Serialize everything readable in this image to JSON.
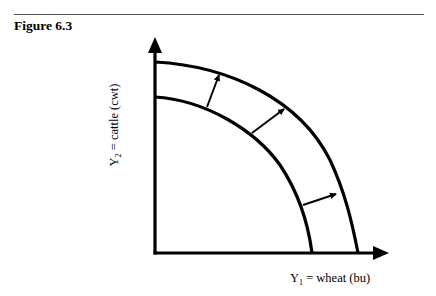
{
  "figure": {
    "label": "Figure 6.3"
  },
  "axes": {
    "y": {
      "var": "Y",
      "subscript": "2",
      "rest": " = cattle (cwt)",
      "full": "Y2 = cattle (cwt)"
    },
    "x": {
      "var": "Y",
      "subscript": "1",
      "rest": " = wheat (bu)",
      "full": "Y1 = wheat (bu)"
    }
  },
  "curves": [
    {
      "name": "inner-production-possibilities-curve",
      "y_intercept_px": [
        155,
        97
      ],
      "x_intercept_px": [
        312,
        253
      ]
    },
    {
      "name": "outer-production-possibilities-curve",
      "y_intercept_px": [
        155,
        62
      ],
      "x_intercept_px": [
        358,
        253
      ]
    }
  ],
  "shift_arrows": [
    {
      "from": [
        207,
        107
      ],
      "to": [
        220,
        73
      ]
    },
    {
      "from": [
        252,
        133
      ],
      "to": [
        286,
        108
      ]
    },
    {
      "from": [
        303,
        205
      ],
      "to": [
        338,
        194
      ]
    }
  ],
  "colors": {
    "stroke": "#000000",
    "rule": "#555555",
    "background": "#ffffff"
  }
}
